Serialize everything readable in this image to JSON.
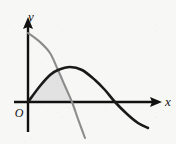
{
  "figure": {
    "kind": "math-plot",
    "width": 176,
    "height": 144,
    "background_color": "#f7f7f5",
    "axis_color": "#111111",
    "labels": {
      "y_axis": "y",
      "x_axis": "x",
      "origin": "O"
    }
  },
  "chart_data": {
    "type": "line",
    "title": "",
    "xlabel": "x",
    "ylabel": "y",
    "grid": false,
    "legend": "none",
    "axis_origin_px": [
      28,
      102
    ],
    "x_axis_arrow_tip_px": [
      162,
      102
    ],
    "y_axis_arrow_tip_px": [
      28,
      17
    ],
    "xlim": [
      0,
      1
    ],
    "ylim": [
      -1,
      1
    ],
    "annotations": [
      {
        "name": "origin-label",
        "text": "O",
        "position_px": [
          19,
          108
        ]
      },
      {
        "name": "y-axis-label",
        "text": "y",
        "position_px": [
          31,
          11
        ]
      },
      {
        "name": "x-axis-label",
        "text": "x",
        "position_px": [
          168,
          103
        ]
      }
    ],
    "series": [
      {
        "name": "gray-curve",
        "color": "#8c8c8c",
        "stroke_width": 2.1,
        "description": "decreasing concave-down curve starting high on the y-axis, crossing the x-axis and continuing steeply downward",
        "path_points_px": [
          [
            28,
            33
          ],
          [
            40,
            42
          ],
          [
            50,
            53
          ],
          [
            58,
            70
          ],
          [
            65,
            86
          ],
          [
            72,
            102
          ],
          [
            78,
            119
          ],
          [
            85,
            138
          ]
        ],
        "y_intercept_px": [
          28,
          33
        ],
        "x_intercept_px": [
          72,
          102
        ]
      },
      {
        "name": "dark-curve",
        "color": "#1a1a1a",
        "stroke_width": 2.6,
        "description": "hump starting at the origin, rising to a maximum then falling back through the x-axis and below",
        "path_points_px": [
          [
            28,
            102
          ],
          [
            40,
            86
          ],
          [
            50,
            75
          ],
          [
            58,
            70
          ],
          [
            70,
            67
          ],
          [
            82,
            70
          ],
          [
            95,
            80
          ],
          [
            105,
            90
          ],
          [
            115,
            102
          ],
          [
            127,
            114
          ],
          [
            138,
            123
          ],
          [
            148,
            128
          ]
        ],
        "origin_point_px": [
          28,
          102
        ],
        "peak_px": [
          70,
          67
        ],
        "x_intercept_px": [
          115,
          102
        ]
      }
    ],
    "shaded_regions": [
      {
        "name": "region-between-curves",
        "fill_color": "#e2e2e2",
        "description": "area bounded above by the dark curve, on the right by the gray curve, and below by the x-axis, from the origin to the gray curve's x-intercept",
        "boundary_points_px": [
          [
            28,
            102
          ],
          [
            40,
            86
          ],
          [
            50,
            75
          ],
          [
            58,
            70
          ],
          [
            65,
            86
          ],
          [
            72,
            102
          ]
        ]
      }
    ],
    "intersections": [
      {
        "name": "curve-intersection",
        "position_px": [
          58,
          70
        ],
        "between": [
          "dark-curve",
          "gray-curve"
        ]
      }
    ]
  }
}
